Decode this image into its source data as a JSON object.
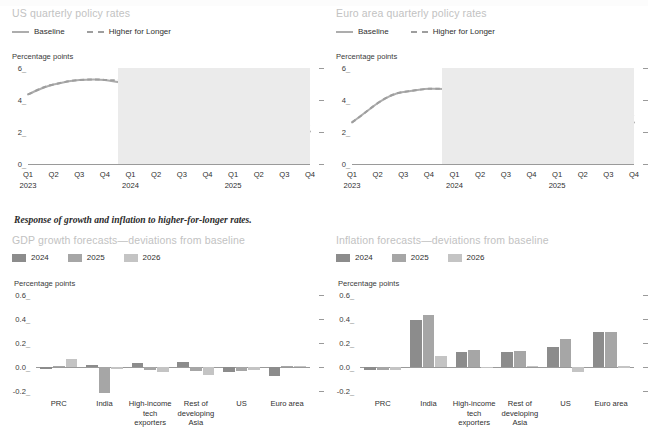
{
  "figure": {
    "section_caption": "Response of growth and inflation to higher-for-longer rates.",
    "unit_label": "Percentage points",
    "colors": {
      "baseline_line": "#adadad",
      "higher_line": "#9e9e9e",
      "shade": "#ebebeb",
      "bar_2024": "#8c8c8c",
      "bar_2025": "#a6a6a6",
      "bar_2026": "#c4c4c4",
      "title_grey": "#c2c2c2",
      "axis_grey": "#9a9a9a"
    }
  },
  "line_legend": {
    "baseline_label": "Baseline",
    "higher_label": "Higher for Longer"
  },
  "bar_legend": {
    "items": [
      {
        "label": "2024",
        "color": "#8c8c8c"
      },
      {
        "label": "2025",
        "color": "#a6a6a6"
      },
      {
        "label": "2026",
        "color": "#c4c4c4"
      }
    ]
  },
  "chart_data": [
    {
      "id": "us-policy-rates",
      "type": "line",
      "title": "US quarterly policy rates",
      "ylabel": "Percentage points",
      "ylim": [
        0,
        6
      ],
      "yticks": [
        0,
        2,
        4,
        6
      ],
      "ytick_labels": [
        "0",
        "2",
        "4",
        "6"
      ],
      "grid": false,
      "legend_position": "top-left",
      "x": [
        "Q1 2023",
        "Q2 2023",
        "Q3 2023",
        "Q4 2023",
        "Q1 2024",
        "Q2 2024",
        "Q3 2024",
        "Q4 2024",
        "Q1 2025",
        "Q2 2025",
        "Q3 2025",
        "Q4 2025"
      ],
      "xtick_labels": [
        "Q1",
        "Q2",
        "Q3",
        "Q4",
        "Q1",
        "Q2",
        "Q3",
        "Q4",
        "Q1",
        "Q2",
        "Q3",
        "Q4"
      ],
      "year_labels": [
        {
          "label": "2023",
          "at": 0
        },
        {
          "label": "2024",
          "at": 4
        },
        {
          "label": "2025",
          "at": 8
        }
      ],
      "forecast_shade_from": 3.5,
      "series": [
        {
          "name": "Baseline",
          "style": "solid",
          "values": [
            4.35,
            4.85,
            5.15,
            5.25,
            5.2,
            4.85,
            4.35,
            3.85,
            3.5,
            3.3,
            3.2,
            3.15
          ]
        },
        {
          "name": "Higher for Longer",
          "style": "dashed",
          "values": [
            4.35,
            4.85,
            5.15,
            5.25,
            5.25,
            5.2,
            5.15,
            5.0,
            4.6,
            4.2,
            3.85,
            3.6
          ]
        }
      ]
    },
    {
      "id": "euro-policy-rates",
      "type": "line",
      "title": "Euro area quarterly policy rates",
      "ylabel": "Percentage points",
      "ylim": [
        0,
        6
      ],
      "yticks": [
        0,
        2,
        4,
        6
      ],
      "ytick_labels": [
        "0",
        "2",
        "4",
        "6"
      ],
      "grid": false,
      "legend_position": "top-left",
      "x": [
        "Q1 2023",
        "Q2 2023",
        "Q3 2023",
        "Q4 2023",
        "Q1 2024",
        "Q2 2024",
        "Q3 2024",
        "Q4 2024",
        "Q1 2025",
        "Q2 2025",
        "Q3 2025",
        "Q4 2025"
      ],
      "xtick_labels": [
        "Q1",
        "Q2",
        "Q3",
        "Q4",
        "Q1",
        "Q2",
        "Q3",
        "Q4",
        "Q1",
        "Q2",
        "Q3",
        "Q4"
      ],
      "year_labels": [
        {
          "label": "2023",
          "at": 0
        },
        {
          "label": "2024",
          "at": 4
        },
        {
          "label": "2025",
          "at": 8
        }
      ],
      "forecast_shade_from": 3.5,
      "series": [
        {
          "name": "Baseline",
          "style": "solid",
          "values": [
            2.6,
            3.55,
            4.0,
            4.3,
            4.25,
            4.1,
            3.75,
            3.5,
            3.3,
            3.2,
            3.1,
            3.05
          ]
        },
        {
          "name": "Higher for Longer",
          "style": "dashed",
          "values": [
            2.6,
            3.55,
            4.0,
            4.3,
            4.3,
            4.25,
            4.2,
            4.1,
            3.95,
            3.8,
            3.6,
            3.45
          ]
        }
      ]
    },
    {
      "id": "gdp-growth-deviations",
      "type": "bar",
      "title": "GDP growth forecasts—deviations from baseline",
      "ylabel": "Percentage points",
      "ylim": [
        -0.2,
        0.6
      ],
      "yticks": [
        -0.2,
        0.0,
        0.2,
        0.4,
        0.6
      ],
      "ytick_labels": [
        "-0.2",
        "0.0",
        "0.2",
        "0.4",
        "0.6"
      ],
      "grid": false,
      "legend_position": "top-left",
      "categories": [
        "PRC",
        "India",
        "High-income\ntech\nexporters",
        "Rest of\ndeveloping\nAsia",
        "US",
        "Euro area"
      ],
      "series": [
        {
          "name": "2024",
          "color": "#8c8c8c",
          "values": [
            -0.015,
            0.02,
            0.035,
            0.045,
            -0.04,
            -0.075
          ]
        },
        {
          "name": "2025",
          "color": "#a6a6a6",
          "values": [
            0.012,
            -0.215,
            -0.025,
            -0.03,
            -0.03,
            0.01
          ]
        },
        {
          "name": "2026",
          "color": "#c4c4c4",
          "values": [
            0.065,
            -0.018,
            -0.045,
            -0.065,
            -0.025,
            0.012
          ]
        }
      ]
    },
    {
      "id": "inflation-deviations",
      "type": "bar",
      "title": "Inflation forecasts—deviations from baseline",
      "ylabel": "Percentage points",
      "ylim": [
        -0.2,
        0.6
      ],
      "yticks": [
        -0.2,
        0.0,
        0.2,
        0.4,
        0.6
      ],
      "ytick_labels": [
        "-0.2",
        "0.0",
        "0.2",
        "0.4",
        "0.6"
      ],
      "grid": false,
      "legend_position": "top-left",
      "categories": [
        "PRC",
        "India",
        "High-income\ntech\nexporters",
        "Rest of\ndeveloping\nAsia",
        "US",
        "Euro area"
      ],
      "series": [
        {
          "name": "2024",
          "color": "#8c8c8c",
          "values": [
            -0.022,
            0.395,
            0.125,
            0.125,
            0.165,
            0.29
          ]
        },
        {
          "name": "2025",
          "color": "#a6a6a6",
          "values": [
            -0.022,
            0.43,
            0.145,
            0.135,
            0.235,
            0.295
          ]
        },
        {
          "name": "2026",
          "color": "#c4c4c4",
          "values": [
            -0.025,
            0.09,
            -0.012,
            0.012,
            -0.04,
            0.005
          ]
        }
      ]
    }
  ]
}
